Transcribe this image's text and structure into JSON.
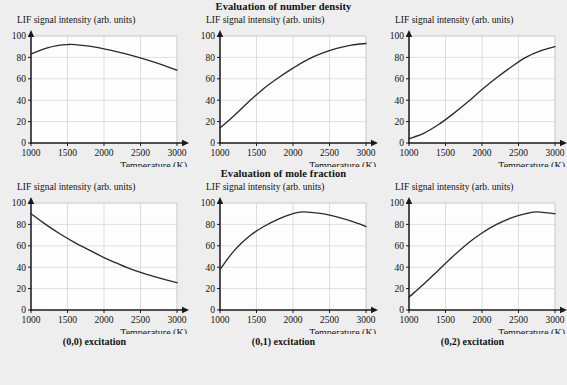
{
  "figure": {
    "background": "#eeeeee",
    "curve_color": "#2b2b2b",
    "grid_color": "#c9c9c9",
    "axis_color": "#1a1a1a",
    "plot_bg": "#fdfdfd"
  },
  "row_titles": [
    "Evaluation of number density",
    "Evaluation of mole fraction"
  ],
  "column_labels": [
    "(0,0) excitation",
    "(0,1) excitation",
    "(0,2) excitation"
  ],
  "axes": {
    "ylabel": "LIF signal intensity (arb. units)",
    "xlabel": "Temperature (K)",
    "xticks": [
      1000,
      1500,
      2000,
      2500,
      3000
    ],
    "yticks": [
      0,
      20,
      40,
      60,
      80,
      100
    ],
    "xlim": [
      1000,
      3000
    ],
    "ylim": [
      0,
      100
    ],
    "grid": true
  },
  "chart_data": [
    {
      "type": "line",
      "title": "Evaluation of number density",
      "panel": "(0,0) excitation",
      "row": 0,
      "col": 0,
      "xlabel": "Temperature (K)",
      "ylabel": "LIF signal intensity (arb. units)",
      "xlim": [
        1000,
        3000
      ],
      "ylim": [
        0,
        100
      ],
      "x": [
        1000,
        1200,
        1400,
        1500,
        1600,
        1800,
        2000,
        2200,
        2400,
        2600,
        2800,
        3000
      ],
      "values": [
        83,
        88.5,
        91.5,
        92,
        92,
        90.5,
        88,
        85,
        81.5,
        77.5,
        73,
        68
      ]
    },
    {
      "type": "line",
      "title": "Evaluation of number density",
      "panel": "(0,1) excitation",
      "row": 0,
      "col": 1,
      "xlabel": "Temperature (K)",
      "ylabel": "LIF signal intensity (arb. units)",
      "xlim": [
        1000,
        3000
      ],
      "ylim": [
        0,
        100
      ],
      "x": [
        1000,
        1200,
        1400,
        1600,
        1800,
        2000,
        2200,
        2400,
        2600,
        2800,
        3000
      ],
      "values": [
        14,
        26,
        39,
        51,
        61,
        70,
        78,
        84,
        88.5,
        91.5,
        93
      ]
    },
    {
      "type": "line",
      "title": "Evaluation of number density",
      "panel": "(0,2) excitation",
      "row": 0,
      "col": 2,
      "xlabel": "Temperature (K)",
      "ylabel": "LIF signal intensity (arb. units)",
      "xlim": [
        1000,
        3000
      ],
      "ylim": [
        0,
        100
      ],
      "x": [
        1000,
        1200,
        1400,
        1600,
        1800,
        2000,
        2200,
        2400,
        2600,
        2800,
        3000
      ],
      "values": [
        4,
        9,
        17,
        27,
        38,
        50,
        61,
        71,
        80,
        86,
        90
      ]
    },
    {
      "type": "line",
      "title": "Evaluation of mole fraction",
      "panel": "(0,0) excitation",
      "row": 1,
      "col": 0,
      "xlabel": "Temperature (K)",
      "ylabel": "LIF signal intensity (arb. units)",
      "xlim": [
        1000,
        3000
      ],
      "ylim": [
        0,
        100
      ],
      "x": [
        1000,
        1200,
        1400,
        1600,
        1800,
        2000,
        2200,
        2400,
        2600,
        2800,
        3000
      ],
      "values": [
        90,
        80,
        71,
        63,
        56,
        49,
        43,
        37.5,
        33,
        29,
        25.5
      ]
    },
    {
      "type": "line",
      "title": "Evaluation of mole fraction",
      "panel": "(0,1) excitation",
      "row": 1,
      "col": 1,
      "xlabel": "Temperature (K)",
      "ylabel": "LIF signal intensity (arb. units)",
      "xlim": [
        1000,
        3000
      ],
      "ylim": [
        0,
        100
      ],
      "x": [
        1000,
        1200,
        1400,
        1600,
        1800,
        2000,
        2100,
        2200,
        2400,
        2600,
        2800,
        3000
      ],
      "values": [
        38,
        56,
        69,
        78,
        85,
        90,
        91.5,
        91.5,
        90,
        87,
        83,
        78
      ]
    },
    {
      "type": "line",
      "title": "Evaluation of mole fraction",
      "panel": "(0,2) excitation",
      "row": 1,
      "col": 2,
      "xlabel": "Temperature (K)",
      "ylabel": "LIF signal intensity (arb. units)",
      "xlim": [
        1000,
        3000
      ],
      "ylim": [
        0,
        100
      ],
      "x": [
        1000,
        1200,
        1400,
        1600,
        1800,
        2000,
        2200,
        2400,
        2600,
        2700,
        2800,
        3000
      ],
      "values": [
        12,
        24,
        37,
        50,
        62,
        72,
        80,
        86,
        90,
        91.5,
        91.5,
        90
      ]
    }
  ]
}
